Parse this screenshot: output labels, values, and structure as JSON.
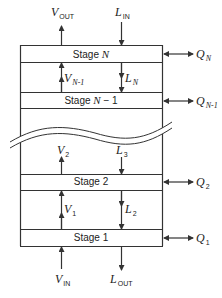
{
  "diagram": {
    "type": "countercurrent staged column",
    "colors": {
      "line": "#333333",
      "background": "#ffffff"
    },
    "stages": [
      {
        "id": "stage-N",
        "label_prefix": "Stage ",
        "label_var": "N",
        "label_suffix": ""
      },
      {
        "id": "stage-N-1",
        "label_prefix": "Stage ",
        "label_var": "N",
        "label_suffix": " − 1"
      },
      {
        "id": "stage-2",
        "label_prefix": "Stage 2",
        "label_var": "",
        "label_suffix": ""
      },
      {
        "id": "stage-1",
        "label_prefix": "Stage 1",
        "label_var": "",
        "label_suffix": ""
      }
    ],
    "streams": {
      "v_out": {
        "sym": "V",
        "sub": "OUT"
      },
      "l_in": {
        "sym": "L",
        "sub": "IN"
      },
      "v_n1": {
        "sym": "V",
        "sub": "N-1"
      },
      "l_n": {
        "sym": "L",
        "sub": "N"
      },
      "v_2": {
        "sym": "V",
        "sub": "2"
      },
      "l_3": {
        "sym": "L",
        "sub": "3"
      },
      "v_1": {
        "sym": "V",
        "sub": "1"
      },
      "l_2": {
        "sym": "L",
        "sub": "2"
      },
      "v_in": {
        "sym": "V",
        "sub": "IN"
      },
      "l_out": {
        "sym": "L",
        "sub": "OUT"
      }
    },
    "heat": [
      {
        "sym": "Q",
        "sub": "N"
      },
      {
        "sym": "Q",
        "sub": "N-1"
      },
      {
        "sym": "Q",
        "sub": "2"
      },
      {
        "sym": "Q",
        "sub": "1"
      }
    ]
  }
}
